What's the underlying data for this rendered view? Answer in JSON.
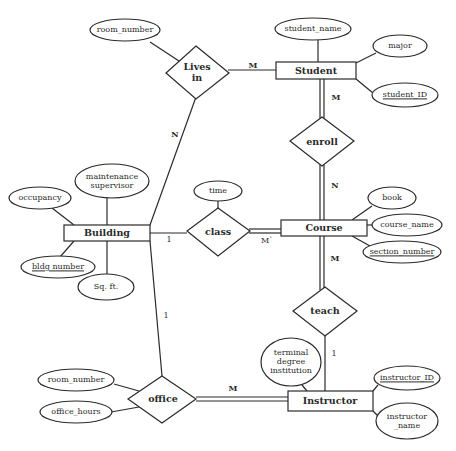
{
  "diagram": {
    "type": "entity-relationship",
    "entities": [
      {
        "id": "student",
        "label": "Student"
      },
      {
        "id": "course",
        "label": "Course"
      },
      {
        "id": "building",
        "label": "Building"
      },
      {
        "id": "instructor",
        "label": "Instructor"
      }
    ],
    "relationships": [
      {
        "id": "lives_in",
        "label_line1": "Lives",
        "label_line2": "in"
      },
      {
        "id": "enroll",
        "label": "enroll"
      },
      {
        "id": "class",
        "label": "class"
      },
      {
        "id": "teach",
        "label": "teach"
      },
      {
        "id": "office",
        "label": "office"
      }
    ],
    "attributes": {
      "lives_in_room_number": "room_number",
      "student_name": "student_name",
      "major": "major",
      "student_id": "student_ID",
      "time": "time",
      "book": "book",
      "course_name": "course_name",
      "section_number": "section_number",
      "maintenance_line1": "maintenance",
      "maintenance_line2": "supervisor",
      "occupancy": "occupancy",
      "bldg_number": "bldg number",
      "sq_ft": "Sq. ft.",
      "office_room_number": "room_number",
      "office_hours": "office_hours",
      "terminal_line1": "terminal",
      "terminal_line2": "degree",
      "terminal_line3": "institution",
      "instructor_id": "instructor_ID",
      "instructor_name_line1": "instructor",
      "instructor_name_line2": "_name"
    },
    "cardinalities": {
      "lives_in_student": "M",
      "lives_in_building": "N",
      "enroll_student": "M",
      "enroll_course": "N",
      "class_building": "1",
      "class_course": "M`",
      "teach_course": "M",
      "teach_instructor": "1",
      "office_building": "1",
      "office_instructor": "M"
    },
    "key_attributes": [
      "student_ID",
      "section_number",
      "bldg number",
      "instructor_ID"
    ],
    "colors": {
      "stroke": "#2a2a2a",
      "background": "#ffffff"
    }
  }
}
